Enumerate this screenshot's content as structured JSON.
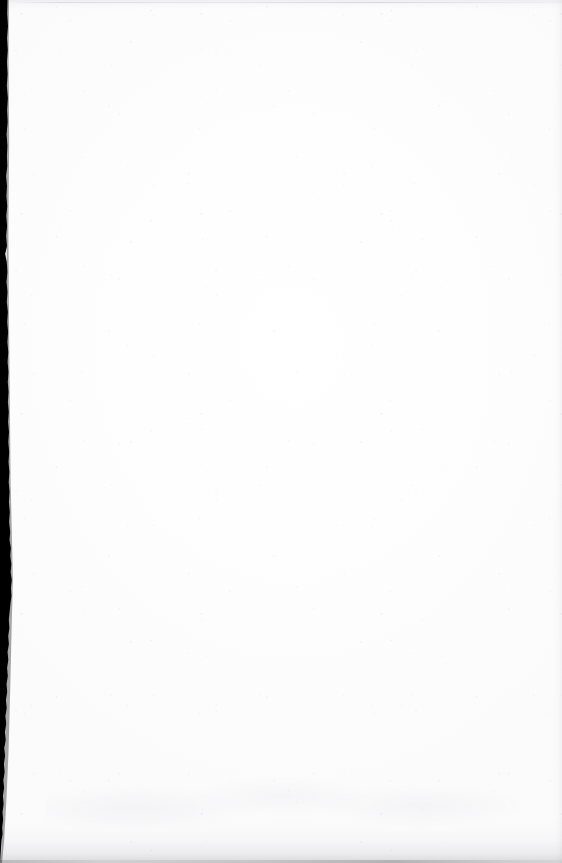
{
  "document": {
    "type": "scanned-page",
    "content_text": "",
    "note": "blank scanned sheet — no printed text, headings, figures or page number visible"
  },
  "canvas": {
    "width_px": 562,
    "height_px": 863,
    "paper_color": "#fefeff",
    "background_color": "#ffffff"
  },
  "artifacts": {
    "binding_strip": {
      "name": "left binding gutter shadow",
      "color": "#000000",
      "edge_px": "left",
      "max_width_px": 12,
      "min_width_px": 2,
      "starts_y_px": 0,
      "fades_out_y_px": 840
    },
    "bottom_edge_shadow": {
      "name": "bottom page edge shadow",
      "color": "#76767e",
      "height_px": 46
    },
    "top_edge_line": {
      "name": "top scanner hairline",
      "color": "#a8a8b0",
      "y_px": 2
    },
    "right_edge_shadow": {
      "name": "right page edge falloff",
      "color": "#b2b2ba",
      "width_px": 10
    },
    "paper_grain": {
      "name": "paper grain speckle noise",
      "color": "#96969e"
    }
  }
}
